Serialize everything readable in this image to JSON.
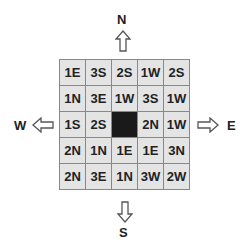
{
  "compass": {
    "north": "N",
    "south": "S",
    "east": "E",
    "west": "W"
  },
  "grid": {
    "rows": [
      [
        "1E",
        "3S",
        "2S",
        "1W",
        "2S"
      ],
      [
        "1N",
        "3E",
        "1W",
        "3S",
        "1W"
      ],
      [
        "1S",
        "2S",
        "",
        "2N",
        "1W"
      ],
      [
        "2N",
        "1N",
        "1E",
        "1E",
        "3N"
      ],
      [
        "2N",
        "3E",
        "1N",
        "3W",
        "2W"
      ]
    ],
    "dark_cell": {
      "row": 2,
      "col": 2
    },
    "cell_color": "#e4e4e4",
    "dark_color": "#1a1a1a",
    "border_color": "#888888"
  }
}
